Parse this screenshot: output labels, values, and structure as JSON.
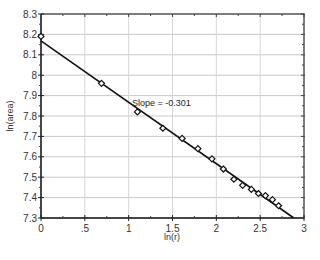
{
  "chart_data": {
    "type": "scatter",
    "title": "",
    "xlabel": "ln(r)",
    "ylabel": "ln(area)",
    "xlim": [
      0,
      3
    ],
    "ylim": [
      7.3,
      8.3
    ],
    "x_ticks": [
      0,
      0.5,
      1,
      1.5,
      2,
      2.5,
      3
    ],
    "x_tick_labels": [
      "0",
      ".5",
      "1",
      "1.5",
      "2",
      "2.5",
      "3"
    ],
    "y_ticks": [
      7.3,
      7.4,
      7.5,
      7.6,
      7.7,
      7.8,
      7.9,
      8,
      8.1,
      8.2,
      8.3
    ],
    "y_tick_labels": [
      "7.3",
      "7.4",
      "7.5",
      "7.6",
      "7.7",
      "7.8",
      "7.9",
      "8",
      "8.1",
      "8.2",
      "8.3"
    ],
    "grid": true,
    "legend": null,
    "series": [
      {
        "name": "data",
        "marker": "open-diamond",
        "x": [
          0,
          0.69,
          1.1,
          1.39,
          1.61,
          1.79,
          1.95,
          2.08,
          2.2,
          2.3,
          2.4,
          2.48,
          2.56,
          2.64,
          2.71
        ],
        "y": [
          8.19,
          7.96,
          7.82,
          7.74,
          7.69,
          7.64,
          7.59,
          7.54,
          7.49,
          7.46,
          7.44,
          7.42,
          7.41,
          7.39,
          7.36
        ]
      }
    ],
    "fit_line": {
      "intercept": 8.168,
      "slope": -0.301,
      "x_range": [
        0,
        2.88
      ]
    },
    "annotations": [
      {
        "text": "Slope = -0.301",
        "x": 1.1,
        "y": 7.85
      }
    ]
  },
  "labels": {
    "xlabel": "ln(r)",
    "ylabel": "ln(area)",
    "slope_annotation": "Slope = -0.301"
  }
}
